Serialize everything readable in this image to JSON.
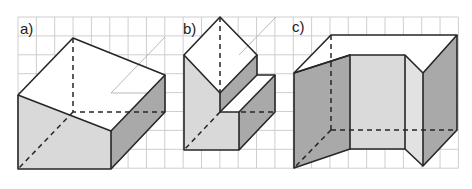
{
  "figure": {
    "type": "isometric-solids-on-grid",
    "grid": {
      "x_start": 18,
      "x_step": 18.35,
      "x_count": 25,
      "y_start": 17,
      "y_step": 18.9,
      "y_count": 9,
      "color": "#c8c8c8"
    },
    "colors": {
      "edge": "#262626",
      "face_light": "#d9d9d9",
      "face_lighter": "#e2e2e2",
      "face_dark": "#a9a9a9",
      "top": "#ffffff"
    },
    "panels": [
      {
        "id": "a",
        "label": "a)",
        "description": "Cuboid with a rhombus-shaped top face viewed obliquely"
      },
      {
        "id": "b",
        "label": "b)",
        "description": "L-shaped stepped prism with square top"
      },
      {
        "id": "c",
        "label": "c)",
        "description": "Open U-shaped folded prism with slanted side panels"
      }
    ]
  }
}
